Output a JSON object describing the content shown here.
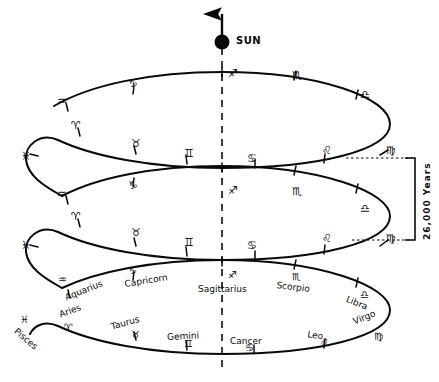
{
  "figure": {
    "sun_label": "SUN",
    "period_label": "26,000 Years",
    "ink_color": "#0a0a0a",
    "background": "#ffffff"
  },
  "axis": {
    "name": "vertical-dashed-axis",
    "x": 222,
    "top": 48,
    "bottom": 372,
    "style": "dashed"
  },
  "sun": {
    "name": "sun-marker",
    "cx": 222,
    "cy": 42,
    "r": 7,
    "arrow_tip_y": 8
  },
  "rings": [
    {
      "id": "ring-top",
      "cx": 222,
      "cy": 124,
      "rx": 168,
      "ry": 44,
      "glyphs": [
        {
          "sign": "Sagittarius",
          "glyph": "♐",
          "x": 228,
          "y": 68,
          "tick": true
        },
        {
          "sign": "Scorpio",
          "glyph": "♏",
          "x": 292,
          "y": 70,
          "tick": true
        },
        {
          "sign": "Libra",
          "glyph": "♎",
          "x": 360,
          "y": 89,
          "tick": true
        },
        {
          "sign": "Virgo",
          "glyph": "♍",
          "x": 386,
          "y": 145,
          "tick": true
        },
        {
          "sign": "Leo",
          "glyph": "♌",
          "x": 322,
          "y": 145,
          "tick": true
        },
        {
          "sign": "Cancer",
          "glyph": "♋",
          "x": 247,
          "y": 153,
          "tick": true
        },
        {
          "sign": "Gemini",
          "glyph": "♊",
          "x": 184,
          "y": 148,
          "tick": true
        },
        {
          "sign": "Taurus",
          "glyph": "♉",
          "x": 131,
          "y": 138,
          "tick": true
        },
        {
          "sign": "Aries",
          "glyph": "♈",
          "x": 71,
          "y": 120,
          "tick": true
        },
        {
          "sign": "Aquarius",
          "glyph": "♒",
          "x": 57,
          "y": 96,
          "tick": true
        },
        {
          "sign": "Capricorn",
          "glyph": "♑",
          "x": 128,
          "y": 78,
          "tick": true
        },
        {
          "sign": "Pisces",
          "glyph": "♓",
          "x": 21,
          "y": 151,
          "tick": true
        }
      ]
    },
    {
      "id": "ring-middle",
      "cx": 222,
      "cy": 216,
      "rx": 168,
      "ry": 44,
      "glyphs": [
        {
          "sign": "Sagittarius",
          "glyph": "♐",
          "x": 228,
          "y": 185,
          "tick": true
        },
        {
          "sign": "Scorpio",
          "glyph": "♏",
          "x": 292,
          "y": 186,
          "tick": true
        },
        {
          "sign": "Libra",
          "glyph": "♎",
          "x": 360,
          "y": 203,
          "tick": true
        },
        {
          "sign": "Virgo",
          "glyph": "♍",
          "x": 386,
          "y": 233,
          "tick": true
        },
        {
          "sign": "Leo",
          "glyph": "♌",
          "x": 322,
          "y": 233,
          "tick": true
        },
        {
          "sign": "Cancer",
          "glyph": "♋",
          "x": 247,
          "y": 240,
          "tick": true
        },
        {
          "sign": "Gemini",
          "glyph": "♊",
          "x": 184,
          "y": 237,
          "tick": true
        },
        {
          "sign": "Taurus",
          "glyph": "♉",
          "x": 131,
          "y": 227,
          "tick": true
        },
        {
          "sign": "Aries",
          "glyph": "♈",
          "x": 71,
          "y": 211,
          "tick": true
        },
        {
          "sign": "Aquarius",
          "glyph": "♒",
          "x": 57,
          "y": 189,
          "tick": true
        },
        {
          "sign": "Capricorn",
          "glyph": "♑",
          "x": 128,
          "y": 180,
          "tick": true
        },
        {
          "sign": "Pisces",
          "glyph": "♓",
          "x": 21,
          "y": 240,
          "tick": true
        }
      ]
    },
    {
      "id": "ring-bottom",
      "cx": 222,
      "cy": 308,
      "rx": 168,
      "ry": 44,
      "glyphs": [
        {
          "sign": "Sagittarius",
          "glyph": "♐",
          "x": 228,
          "y": 270,
          "tick": true
        },
        {
          "sign": "Scorpio",
          "glyph": "♏",
          "x": 292,
          "y": 272,
          "tick": true
        },
        {
          "sign": "Libra",
          "glyph": "♎",
          "x": 360,
          "y": 290,
          "tick": true
        },
        {
          "sign": "Virgo",
          "glyph": "♍",
          "x": 374,
          "y": 332,
          "tick": false
        },
        {
          "sign": "Leo",
          "glyph": "♌",
          "x": 320,
          "y": 338,
          "tick": true
        },
        {
          "sign": "Cancer",
          "glyph": "♋",
          "x": 245,
          "y": 343,
          "tick": true
        },
        {
          "sign": "Gemini",
          "glyph": "♊",
          "x": 184,
          "y": 339,
          "tick": true
        },
        {
          "sign": "Taurus",
          "glyph": "♉",
          "x": 131,
          "y": 330,
          "tick": true
        },
        {
          "sign": "Aries",
          "glyph": "♈",
          "x": 64,
          "y": 323,
          "tick": false
        },
        {
          "sign": "Aquarius",
          "glyph": "♒",
          "x": 58,
          "y": 275,
          "tick": true
        },
        {
          "sign": "Capricorn",
          "glyph": "♑",
          "x": 128,
          "y": 266,
          "tick": true
        },
        {
          "sign": "Pisces",
          "glyph": "♓",
          "x": 20,
          "y": 315,
          "tick": false
        }
      ],
      "names": [
        {
          "text": "Aquarius",
          "x": 64,
          "y": 294,
          "rot": -22
        },
        {
          "text": "Capricorn",
          "x": 124,
          "y": 280,
          "rot": -9
        },
        {
          "text": "Sagittarius",
          "x": 198,
          "y": 285,
          "rot": 0
        },
        {
          "text": "Scorpio",
          "x": 277,
          "y": 281,
          "rot": 7
        },
        {
          "text": "Libra",
          "x": 348,
          "y": 295,
          "rot": 22
        },
        {
          "text": "Pisces",
          "x": 18,
          "y": 327,
          "rot": 40
        },
        {
          "text": "Aries",
          "x": 58,
          "y": 311,
          "rot": -20
        },
        {
          "text": "Taurus",
          "x": 110,
          "y": 323,
          "rot": -16
        },
        {
          "text": "Gemini",
          "x": 167,
          "y": 333,
          "rot": -3
        },
        {
          "text": "Cancer",
          "x": 230,
          "y": 337,
          "rot": 0
        },
        {
          "text": "Leo",
          "x": 308,
          "y": 330,
          "rot": 9
        },
        {
          "text": "Virgo",
          "x": 352,
          "y": 318,
          "rot": -22
        }
      ]
    }
  ],
  "bracket": {
    "name": "period-bracket",
    "x": 415,
    "top": 158,
    "bottom": 240,
    "leader_left_top": 345,
    "leader_left_bottom": 352,
    "label": "26,000 Years",
    "label_x": 433,
    "label_y": 240
  }
}
